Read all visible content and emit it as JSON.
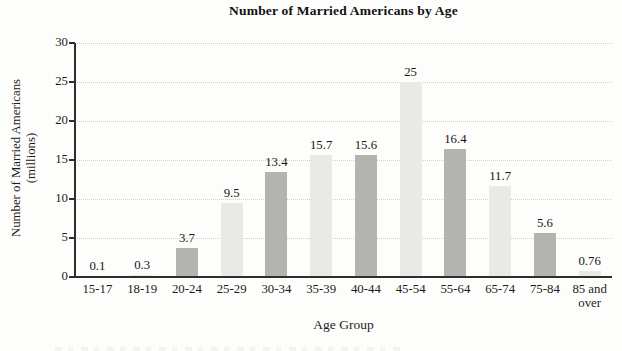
{
  "figure": {
    "title": "Number of Married Americans by Age",
    "x_axis_title": "Age Group",
    "y_axis_title_line1": "Number of Married Americans",
    "y_axis_title_line2": "(millions)"
  },
  "chart_data": {
    "type": "bar",
    "title": "Number of Married Americans by Age",
    "xlabel": "Age Group",
    "ylabel": "Number of Married Americans (millions)",
    "categories": [
      "15-17",
      "18-19",
      "20-24",
      "25-29",
      "30-34",
      "35-39",
      "40-44",
      "45-54",
      "55-64",
      "65-74",
      "75-84",
      "85 and over"
    ],
    "values": [
      0.1,
      0.3,
      3.7,
      9.5,
      13.4,
      15.7,
      15.6,
      25,
      16.4,
      11.7,
      5.6,
      0.76
    ],
    "value_labels": [
      "0.1",
      "0.3",
      "3.7",
      "9.5",
      "13.4",
      "15.7",
      "15.6",
      "25",
      "16.4",
      "11.7",
      "5.6",
      "0.76"
    ],
    "ylim": [
      0,
      30
    ],
    "yticks": [
      0,
      5,
      10,
      15,
      20,
      25,
      30
    ],
    "grid": true,
    "gridline_style": "dotted",
    "legend_position": "none",
    "bar_color_odd_slots": "#b3b3b0",
    "bar_color_even_slots": "#e9e9e5",
    "bar_color_pattern": "alternating starting dark",
    "axis_color": "#2e2e2c",
    "grid_color": "#cfcfc7",
    "background_color": "#fdfdfb"
  }
}
